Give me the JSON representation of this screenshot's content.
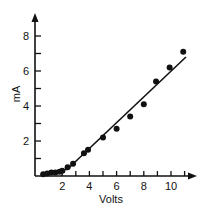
{
  "chart_data": {
    "type": "scatter",
    "title": "",
    "xlabel": "Volts",
    "ylabel": "mA",
    "xlim": [
      0,
      11.5
    ],
    "ylim": [
      0,
      9
    ],
    "x_ticks": [
      1,
      2,
      3,
      4,
      5,
      6,
      7,
      8,
      9,
      10,
      11
    ],
    "x_tick_labels": [
      {
        "value": 2,
        "label": "2"
      },
      {
        "value": 4,
        "label": "4"
      },
      {
        "value": 6,
        "label": "6"
      },
      {
        "value": 8,
        "label": "8"
      },
      {
        "value": 10,
        "label": "10"
      }
    ],
    "y_ticks": [
      1,
      2,
      3,
      4,
      5,
      6,
      7,
      8
    ],
    "y_tick_labels": [
      {
        "value": 2,
        "label": "2"
      },
      {
        "value": 4,
        "label": "4"
      },
      {
        "value": 6,
        "label": "6"
      },
      {
        "value": 8,
        "label": "8"
      }
    ],
    "grid": false,
    "legend": null,
    "series": [
      {
        "name": "measured",
        "marker": "filled-circle",
        "points": [
          {
            "x": 0.6,
            "y": 0.1
          },
          {
            "x": 0.9,
            "y": 0.15
          },
          {
            "x": 1.2,
            "y": 0.2
          },
          {
            "x": 1.5,
            "y": 0.2
          },
          {
            "x": 1.8,
            "y": 0.25
          },
          {
            "x": 2.0,
            "y": 0.3
          },
          {
            "x": 2.4,
            "y": 0.5
          },
          {
            "x": 2.8,
            "y": 0.7
          },
          {
            "x": 3.6,
            "y": 1.3
          },
          {
            "x": 3.9,
            "y": 1.5
          },
          {
            "x": 5.0,
            "y": 2.2
          },
          {
            "x": 6.0,
            "y": 2.7
          },
          {
            "x": 7.0,
            "y": 3.4
          },
          {
            "x": 8.0,
            "y": 4.1
          },
          {
            "x": 8.9,
            "y": 5.4
          },
          {
            "x": 9.9,
            "y": 6.2
          },
          {
            "x": 10.9,
            "y": 7.1
          }
        ]
      }
    ],
    "fit_line": {
      "style": "solid",
      "from": {
        "x": 2.4,
        "y": 0.4
      },
      "to": {
        "x": 11.1,
        "y": 6.8
      },
      "low_segment": {
        "from": {
          "x": 0.5,
          "y": 0.05
        },
        "to": {
          "x": 2.4,
          "y": 0.4
        }
      },
      "dashed_extension": {
        "from": {
          "x": 1.9,
          "y": 0.0
        },
        "to": {
          "x": 2.4,
          "y": 0.4
        }
      }
    }
  }
}
